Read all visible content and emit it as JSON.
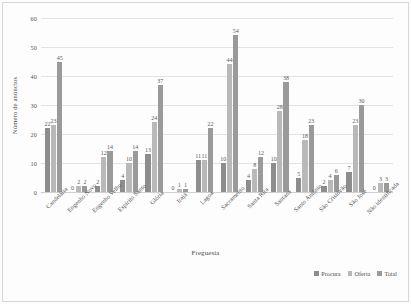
{
  "chart_data": {
    "type": "bar",
    "title": "",
    "xlabel": "Freguesia",
    "ylabel": "Número de anúncios",
    "ylim": [
      0,
      60
    ],
    "yticks": [
      0,
      10,
      20,
      30,
      40,
      50,
      60
    ],
    "grid": true,
    "legend_position": "bottom-right",
    "categories": [
      "Candelária",
      "Engenho Novo",
      "Engenho Velho",
      "Espírito Santo",
      "Glória",
      "Irajá",
      "Lagoa",
      "Sacramento",
      "Santa Rita",
      "Santana",
      "Santo Antônio",
      "São Cristóvão",
      "São José",
      "Não identificada"
    ],
    "series": [
      {
        "name": "Procura",
        "color": "#8d8d8d",
        "values": [
          22,
          0,
          2,
          4,
          13,
          0,
          11,
          10,
          4,
          10,
          5,
          2,
          7,
          0
        ]
      },
      {
        "name": "Oferta",
        "color": "#b9b9b9",
        "values": [
          23,
          2,
          12,
          10,
          24,
          1,
          11,
          44,
          8,
          28,
          18,
          4,
          23,
          3
        ]
      },
      {
        "name": "Total",
        "color": "#9a9a9a",
        "values": [
          45,
          2,
          14,
          14,
          37,
          1,
          22,
          54,
          12,
          38,
          23,
          6,
          30,
          3
        ]
      }
    ]
  }
}
